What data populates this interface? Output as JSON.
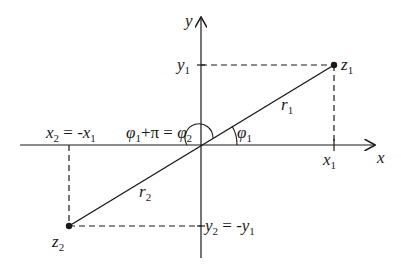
{
  "diagram": {
    "title": "",
    "type": "complex-plane",
    "axes": {
      "x_label": "x",
      "y_label": "y"
    },
    "points": [
      {
        "name": "z",
        "sub": "1",
        "x": 334,
        "y": 65
      },
      {
        "name": "z",
        "sub": "2",
        "x": 69,
        "y": 226
      }
    ],
    "labels": {
      "x1": {
        "base": "x",
        "sub": "1"
      },
      "y1": {
        "base": "y",
        "sub": "1"
      },
      "r1": {
        "base": "r",
        "sub": "1"
      },
      "r2": {
        "base": "r",
        "sub": "2"
      },
      "phi1": {
        "base": "φ",
        "sub": "1"
      },
      "x2_eq": {
        "base": "x",
        "sub": "2",
        "eq": " = -",
        "rhs": "x",
        "rhs_sub": "1"
      },
      "y2_eq": {
        "base": "y",
        "sub": "2",
        "eq": " = -",
        "rhs": "y",
        "rhs_sub": "1"
      },
      "phi_relation": {
        "a": "φ",
        "a_sub": "1",
        "plus": "+π = ",
        "b": "φ",
        "b_sub": "2"
      }
    },
    "colors": {
      "line": "#1a1a1a",
      "background": "#ffffff"
    }
  }
}
